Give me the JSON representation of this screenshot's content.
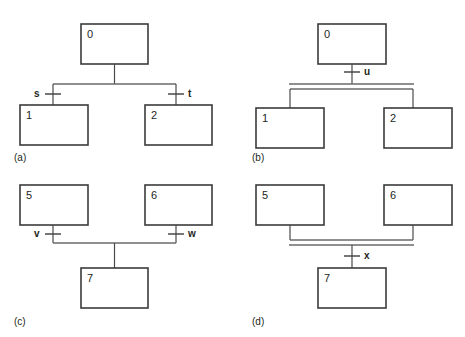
{
  "figure": {
    "background_color": "#ffffff",
    "stroke_color": "#3b3b3b",
    "bus_color": "#6a6a6a",
    "text_color": "#231f20"
  },
  "panels": [
    {
      "id": "a",
      "caption": "(a)",
      "structure": "one-source-two-targets-single-bus",
      "boxes": [
        {
          "label": "0",
          "role": "source"
        },
        {
          "label": "1",
          "role": "target-left"
        },
        {
          "label": "2",
          "role": "target-right"
        }
      ],
      "tick_labels": [
        {
          "text": "s",
          "side": "left"
        },
        {
          "text": "t",
          "side": "right"
        }
      ],
      "bus_lines": 1
    },
    {
      "id": "b",
      "caption": "(b)",
      "structure": "one-source-two-targets-double-bus",
      "boxes": [
        {
          "label": "0",
          "role": "source"
        },
        {
          "label": "1",
          "role": "target-left"
        },
        {
          "label": "2",
          "role": "target-right"
        }
      ],
      "tick_labels": [
        {
          "text": "u",
          "side": "right"
        }
      ],
      "bus_lines": 2
    },
    {
      "id": "c",
      "caption": "(c)",
      "structure": "two-sources-one-target-single-bus",
      "boxes": [
        {
          "label": "5",
          "role": "source-left"
        },
        {
          "label": "6",
          "role": "source-right"
        },
        {
          "label": "7",
          "role": "target"
        }
      ],
      "tick_labels": [
        {
          "text": "v",
          "side": "left"
        },
        {
          "text": "w",
          "side": "right"
        }
      ],
      "bus_lines": 1
    },
    {
      "id": "d",
      "caption": "(d)",
      "structure": "two-sources-one-target-double-bus",
      "boxes": [
        {
          "label": "5",
          "role": "source-left"
        },
        {
          "label": "6",
          "role": "source-right"
        },
        {
          "label": "7",
          "role": "target"
        }
      ],
      "tick_labels": [
        {
          "text": "x",
          "side": "right"
        }
      ],
      "bus_lines": 2
    }
  ]
}
